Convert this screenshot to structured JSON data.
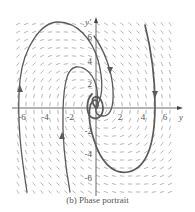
{
  "figure": {
    "caption": "(b) Phase portrait",
    "x_axis_label": "y",
    "y_axis_label": "y'",
    "x_ticks": [
      "-6",
      "-4",
      "-2",
      "2",
      "4",
      "6"
    ],
    "y_ticks": [
      "6",
      "4",
      "2",
      "-2",
      "-4",
      "-6"
    ],
    "colors": {
      "curve": "#555555",
      "field": "#999999",
      "axis": "#444444"
    }
  },
  "chart_data": {
    "type": "phase-portrait",
    "title": "(b) Phase portrait",
    "xlabel": "y",
    "ylabel": "y'",
    "xlim": [
      -7,
      7
    ],
    "ylim": [
      -7,
      7
    ],
    "x_ticks": [
      -6,
      -4,
      -2,
      2,
      4,
      6
    ],
    "y_ticks": [
      -6,
      -4,
      -2,
      2,
      4,
      6
    ],
    "direction_field": true,
    "equilibrium": [
      0,
      0
    ],
    "equilibrium_type": "stable spiral",
    "trajectories": [
      {
        "name": "outer-left",
        "approx_points": [
          [
            -2,
            -7
          ],
          [
            -6.2,
            0
          ],
          [
            -5.5,
            4.5
          ],
          [
            -3.5,
            6.5
          ],
          [
            -1,
            5
          ],
          [
            0.5,
            2
          ],
          [
            0,
            0
          ]
        ]
      },
      {
        "name": "inner-left",
        "approx_points": [
          [
            -0.7,
            -7
          ],
          [
            -2.7,
            0
          ],
          [
            -2.3,
            3.2
          ],
          [
            -1,
            3.2
          ],
          [
            0.2,
            1
          ],
          [
            0,
            0
          ]
        ]
      },
      {
        "name": "top-right",
        "approx_points": [
          [
            0,
            6.5
          ],
          [
            1.5,
            3
          ],
          [
            1.4,
            0
          ],
          [
            0.3,
            -0.6
          ],
          [
            0,
            0
          ]
        ]
      },
      {
        "name": "far-right",
        "approx_points": [
          [
            4.3,
            6.7
          ],
          [
            5,
            0
          ],
          [
            4.3,
            -4
          ],
          [
            2.5,
            -5.4
          ],
          [
            0.5,
            -3.5
          ],
          [
            -0.6,
            -1
          ],
          [
            -0.2,
            0.7
          ],
          [
            0,
            0
          ]
        ]
      }
    ]
  }
}
